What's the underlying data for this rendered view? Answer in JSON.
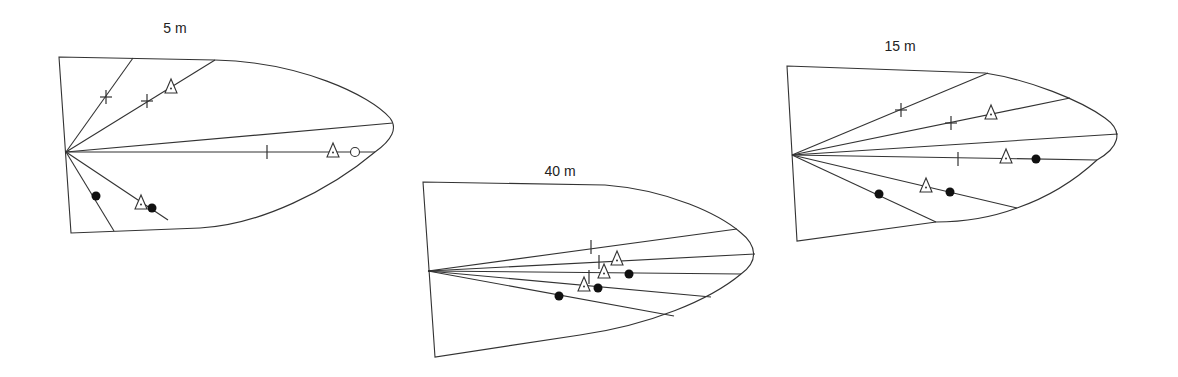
{
  "figure": {
    "background": "#ffffff",
    "stroke_color": "#333333",
    "marker_legend_symbols": {
      "plus": "plus-marker",
      "bar": "vertical-tick-marker",
      "triangle": "open-triangle-with-dot-marker",
      "dot": "filled-circle-marker",
      "circle": "open-circle-marker"
    }
  },
  "panels": [
    {
      "id": "panel-5m",
      "title": "5 m",
      "title_pos": [
        175,
        33
      ],
      "outline": "M59,57 L215,60 C300,62 370,95 390,118 C398,128 392,140 375,152 C330,190 260,225 200,228 L71,233 Z",
      "origin": [
        66,
        152
      ],
      "rays": [
        [
          133,
          58
        ],
        [
          215,
          60
        ],
        [
          393,
          123
        ],
        [
          375,
          152
        ],
        [
          114,
          231
        ],
        [
          168,
          220
        ]
      ],
      "markers": [
        {
          "type": "plus",
          "x": 106,
          "y": 97
        },
        {
          "type": "plus",
          "x": 147,
          "y": 101
        },
        {
          "type": "triangle",
          "x": 171,
          "y": 87
        },
        {
          "type": "bar",
          "x": 267,
          "y": 152
        },
        {
          "type": "triangle",
          "x": 333,
          "y": 151
        },
        {
          "type": "circle",
          "x": 355,
          "y": 152
        },
        {
          "type": "dot",
          "x": 96,
          "y": 196
        },
        {
          "type": "triangle",
          "x": 141,
          "y": 203
        },
        {
          "type": "dot",
          "x": 152,
          "y": 208
        }
      ]
    },
    {
      "id": "panel-40m",
      "title": "40 m",
      "title_pos": [
        560,
        176
      ],
      "outline": "M423,182 L605,185 C670,190 720,215 740,232 C758,246 758,262 741,274 C710,300 650,325 580,335 L435,357 Z",
      "origin": [
        428,
        271
      ],
      "rays": [
        [
          737,
          229
        ],
        [
          755,
          254
        ],
        [
          741,
          274
        ],
        [
          711,
          297
        ],
        [
          674,
          316
        ]
      ],
      "markers": [
        {
          "type": "bar",
          "x": 591,
          "y": 247
        },
        {
          "type": "bar",
          "x": 599,
          "y": 262
        },
        {
          "type": "bar",
          "x": 589,
          "y": 277
        },
        {
          "type": "triangle",
          "x": 617,
          "y": 259
        },
        {
          "type": "triangle",
          "x": 604,
          "y": 272
        },
        {
          "type": "triangle",
          "x": 584,
          "y": 285
        },
        {
          "type": "dot",
          "x": 629,
          "y": 274
        },
        {
          "type": "dot",
          "x": 598,
          "y": 288
        },
        {
          "type": "dot",
          "x": 559,
          "y": 296
        }
      ]
    },
    {
      "id": "panel-15m",
      "title": "15 m",
      "title_pos": [
        900,
        51
      ],
      "outline": "M787,66 L985,73 C1030,80 1080,100 1105,118 C1125,132 1118,148 1097,160 C1070,185 1040,200 1017,208 C990,218 960,222 936,222 L797,241 Z",
      "origin": [
        792,
        155
      ],
      "rays": [
        [
          988,
          73
        ],
        [
          1070,
          98
        ],
        [
          1118,
          134
        ],
        [
          1097,
          160
        ],
        [
          1017,
          208
        ],
        [
          936,
          222
        ]
      ],
      "markers": [
        {
          "type": "plus",
          "x": 901,
          "y": 110
        },
        {
          "type": "plus",
          "x": 951,
          "y": 123
        },
        {
          "type": "triangle",
          "x": 991,
          "y": 113
        },
        {
          "type": "bar",
          "x": 958,
          "y": 159
        },
        {
          "type": "triangle",
          "x": 1006,
          "y": 157
        },
        {
          "type": "dot",
          "x": 1036,
          "y": 159
        },
        {
          "type": "triangle",
          "x": 926,
          "y": 186
        },
        {
          "type": "dot",
          "x": 950,
          "y": 192
        },
        {
          "type": "dot",
          "x": 879,
          "y": 194
        }
      ]
    }
  ]
}
